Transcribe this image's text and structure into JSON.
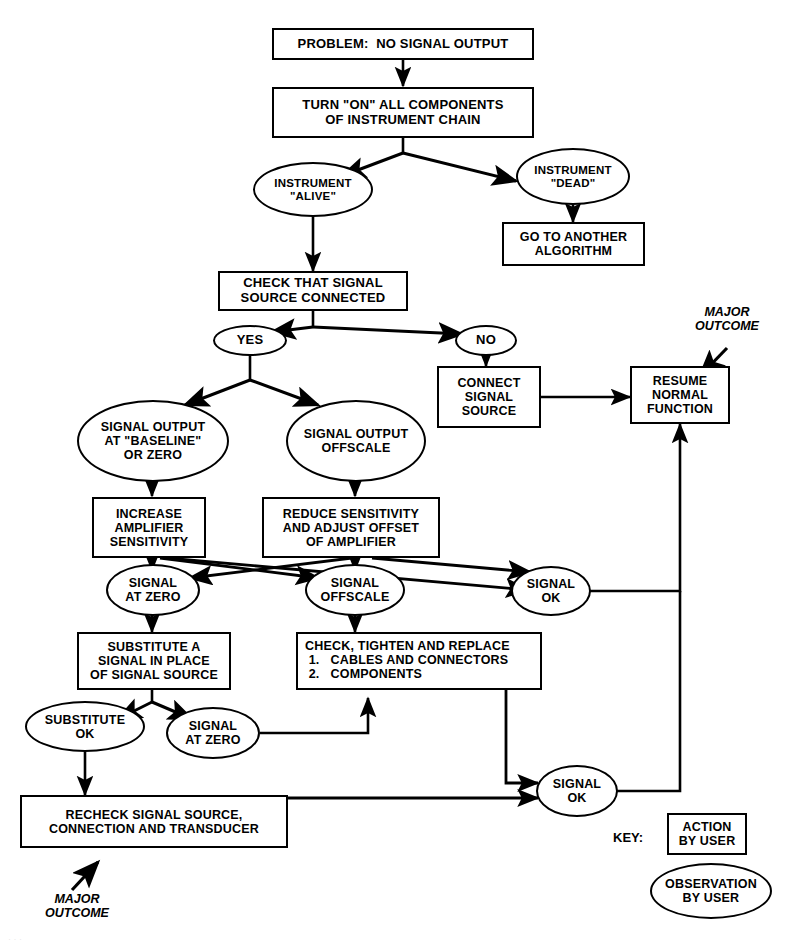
{
  "diagram": {
    "background_color": "#ffffff",
    "line_color": "#000000",
    "nodes": {
      "problem": {
        "label": "PROBLEM:  NO SIGNAL OUTPUT",
        "shape": "box",
        "role": "action-by-user"
      },
      "turn_on": {
        "label": "TURN \"ON\" ALL COMPONENTS\nOF INSTRUMENT CHAIN",
        "shape": "box",
        "role": "action-by-user"
      },
      "instrument_alive": {
        "label": "INSTRUMENT\n\"ALIVE\"",
        "shape": "ellipse",
        "role": "observation-by-user"
      },
      "instrument_dead": {
        "label": "INSTRUMENT\n\"DEAD\"",
        "shape": "ellipse",
        "role": "observation-by-user"
      },
      "go_to_another": {
        "label": "GO TO ANOTHER\nALGORITHM",
        "shape": "box",
        "role": "action-by-user"
      },
      "check_source": {
        "label": "CHECK THAT SIGNAL\nSOURCE CONNECTED",
        "shape": "box",
        "role": "action-by-user"
      },
      "yes": {
        "label": "YES",
        "shape": "ellipse",
        "role": "observation-by-user"
      },
      "no": {
        "label": "NO",
        "shape": "ellipse",
        "role": "observation-by-user"
      },
      "connect_source": {
        "label": "CONNECT\nSIGNAL\nSOURCE",
        "shape": "box",
        "role": "action-by-user"
      },
      "resume_normal": {
        "label": "RESUME\nNORMAL\nFUNCTION",
        "shape": "box",
        "role": "action-by-user"
      },
      "baseline_zero": {
        "label": "SIGNAL OUTPUT\nAT \"BASELINE\"\nOR ZERO",
        "shape": "ellipse",
        "role": "observation-by-user"
      },
      "output_offscale": {
        "label": "SIGNAL OUTPUT\nOFFSCALE",
        "shape": "ellipse",
        "role": "observation-by-user"
      },
      "increase_gain": {
        "label": "INCREASE\nAMPLIFIER\nSENSITIVITY",
        "shape": "box",
        "role": "action-by-user"
      },
      "reduce_gain": {
        "label": "REDUCE SENSITIVITY\nAND ADJUST OFFSET\nOF AMPLIFIER",
        "shape": "box",
        "role": "action-by-user"
      },
      "signal_at_zero_1": {
        "label": "SIGNAL\nAT ZERO",
        "shape": "ellipse",
        "role": "observation-by-user"
      },
      "signal_offscale_1": {
        "label": "SIGNAL\nOFFSCALE",
        "shape": "ellipse",
        "role": "observation-by-user"
      },
      "signal_ok_1": {
        "label": "SIGNAL\nOK",
        "shape": "ellipse",
        "role": "observation-by-user"
      },
      "substitute_signal": {
        "label": "SUBSTITUTE A\nSIGNAL IN PLACE\nOF SIGNAL SOURCE",
        "shape": "box",
        "role": "action-by-user"
      },
      "check_tighten": {
        "label": "CHECK, TIGHTEN AND REPLACE\n 1.   CABLES AND CONNECTORS\n 2.   COMPONENTS",
        "shape": "box",
        "role": "action-by-user"
      },
      "substitute_ok": {
        "label": "SUBSTITUTE\nOK",
        "shape": "ellipse",
        "role": "observation-by-user"
      },
      "signal_at_zero_2": {
        "label": "SIGNAL\nAT ZERO",
        "shape": "ellipse",
        "role": "observation-by-user"
      },
      "signal_ok_2": {
        "label": "SIGNAL\nOK",
        "shape": "ellipse",
        "role": "observation-by-user"
      },
      "recheck": {
        "label": "RECHECK SIGNAL SOURCE,\nCONNECTION AND TRANSDUCER",
        "shape": "box",
        "role": "action-by-user"
      }
    },
    "annotations": {
      "major_outcome_top": "MAJOR\nOUTCOME",
      "major_outcome_bottom": "MAJOR\nOUTCOME"
    },
    "key": {
      "label": "KEY:",
      "action_label": "ACTION\nBY USER",
      "observation_label": "OBSERVATION\nBY USER"
    },
    "edges": [
      {
        "from": "problem",
        "to": "turn_on",
        "style": "arrow"
      },
      {
        "from": "turn_on",
        "to": "instrument_alive",
        "style": "arrow"
      },
      {
        "from": "turn_on",
        "to": "instrument_dead",
        "style": "arrow"
      },
      {
        "from": "instrument_dead",
        "to": "go_to_another",
        "style": "arrow"
      },
      {
        "from": "instrument_alive",
        "to": "check_source",
        "style": "arrow"
      },
      {
        "from": "check_source",
        "to": "yes",
        "style": "arrow"
      },
      {
        "from": "check_source",
        "to": "no",
        "style": "arrow"
      },
      {
        "from": "no",
        "to": "connect_source",
        "style": "arrow"
      },
      {
        "from": "connect_source",
        "to": "resume_normal",
        "style": "arrow"
      },
      {
        "from": "yes",
        "to": "baseline_zero",
        "style": "arrow"
      },
      {
        "from": "yes",
        "to": "output_offscale",
        "style": "arrow"
      },
      {
        "from": "baseline_zero",
        "to": "increase_gain",
        "style": "arrow"
      },
      {
        "from": "output_offscale",
        "to": "reduce_gain",
        "style": "arrow"
      },
      {
        "from": "increase_gain",
        "to": "signal_at_zero_1",
        "style": "arrow"
      },
      {
        "from": "increase_gain",
        "to": "signal_offscale_1",
        "style": "arrow"
      },
      {
        "from": "increase_gain",
        "to": "signal_ok_1",
        "style": "arrow"
      },
      {
        "from": "reduce_gain",
        "to": "signal_at_zero_1",
        "style": "arrow"
      },
      {
        "from": "reduce_gain",
        "to": "signal_offscale_1",
        "style": "arrow"
      },
      {
        "from": "reduce_gain",
        "to": "signal_ok_1",
        "style": "arrow"
      },
      {
        "from": "signal_at_zero_1",
        "to": "substitute_signal",
        "style": "arrow"
      },
      {
        "from": "signal_offscale_1",
        "to": "check_tighten",
        "style": "arrow"
      },
      {
        "from": "signal_ok_1",
        "to": "resume_normal",
        "style": "routed-arrow"
      },
      {
        "from": "substitute_signal",
        "to": "substitute_ok",
        "style": "arrow"
      },
      {
        "from": "substitute_signal",
        "to": "signal_at_zero_2",
        "style": "arrow"
      },
      {
        "from": "signal_at_zero_2",
        "to": "check_tighten",
        "style": "routed-arrow"
      },
      {
        "from": "substitute_ok",
        "to": "recheck",
        "style": "arrow"
      },
      {
        "from": "check_tighten",
        "to": "signal_ok_2",
        "style": "routed-arrow"
      },
      {
        "from": "recheck",
        "to": "signal_ok_2",
        "style": "routed-arrow"
      },
      {
        "from": "signal_ok_2",
        "to": "resume_normal",
        "style": "routed-arrow"
      }
    ]
  }
}
